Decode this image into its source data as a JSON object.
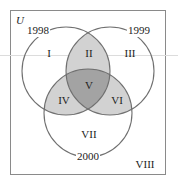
{
  "diagram": {
    "type": "venn-3-set",
    "universe_label": "U",
    "sets": [
      {
        "name": "1998",
        "cx": 66,
        "cy": 71,
        "r": 44,
        "label_x": 38,
        "label_y": 34
      },
      {
        "name": "1999",
        "cx": 110,
        "cy": 71,
        "r": 44,
        "label_x": 139,
        "label_y": 34
      },
      {
        "name": "2000",
        "cx": 88,
        "cy": 113,
        "r": 44,
        "label_x": 88,
        "label_y": 160
      }
    ],
    "regions": [
      {
        "id": "I",
        "x": 49,
        "y": 57,
        "shade": "none"
      },
      {
        "id": "II",
        "x": 89,
        "y": 57,
        "shade": "light"
      },
      {
        "id": "III",
        "x": 130,
        "y": 57,
        "shade": "none"
      },
      {
        "id": "IV",
        "x": 64,
        "y": 104,
        "shade": "light"
      },
      {
        "id": "V",
        "x": 89,
        "y": 89,
        "shade": "dark"
      },
      {
        "id": "VI",
        "x": 117,
        "y": 104,
        "shade": "light"
      },
      {
        "id": "VII",
        "x": 89,
        "y": 138,
        "shade": "none"
      },
      {
        "id": "VIII",
        "x": 145,
        "y": 168,
        "shade": "none"
      }
    ],
    "colors": {
      "stroke": "#707070",
      "box_stroke": "#8a8a8a",
      "light_shade": "#d2d2d2",
      "dark_shade": "#a3a3a3",
      "text": "#222222"
    }
  }
}
